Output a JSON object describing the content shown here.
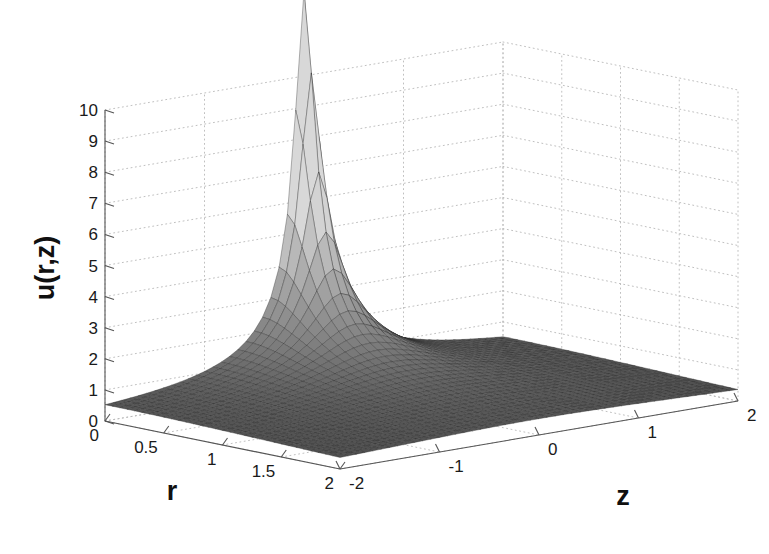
{
  "figure": {
    "type": "surface-plot-3d",
    "background_color": "#ffffff",
    "width": 769,
    "height": 554
  },
  "axes": {
    "vertical": {
      "title": "u(r,z)",
      "ticks": [
        "0",
        "1",
        "2",
        "3",
        "4",
        "5",
        "6",
        "7",
        "8",
        "9",
        "10"
      ],
      "min": 0,
      "max": 10
    },
    "left_horizontal": {
      "title": "r",
      "ticks": [
        "0",
        "0.5",
        "1",
        "1.5",
        "2"
      ],
      "min": 0,
      "max": 2
    },
    "right_horizontal": {
      "title": "z",
      "ticks": [
        "-2",
        "-1",
        "0",
        "1",
        "2"
      ],
      "min": -2,
      "max": 2
    }
  },
  "chart_data": {
    "type": "surface",
    "title": "",
    "xlabel": "r",
    "ylabel": "z",
    "zlabel": "u(r,z)",
    "xlim": [
      0,
      2
    ],
    "ylim": [
      -2,
      2
    ],
    "zlim": [
      0,
      10
    ],
    "xticks": [
      0,
      0.5,
      1,
      1.5,
      2
    ],
    "yticks": [
      -2,
      -1,
      0,
      1,
      2
    ],
    "zticks": [
      0,
      1,
      2,
      3,
      4,
      5,
      6,
      7,
      8,
      9,
      10
    ],
    "grid": true,
    "legend": "none",
    "colormap": "gray",
    "shading": "faceted",
    "peak_location": {
      "r": 0.0,
      "z": 0.0
    },
    "peak_value_approx": 12.5,
    "surface_model": {
      "form": "amplitude / sqrt(r^2 + z^2 + eps2)",
      "amplitude": 1.05,
      "eps2": 0.0068
    },
    "grid_resolution": {
      "nr": 33,
      "nz": 49
    },
    "sample_points": [
      {
        "r": 0.0,
        "z": 0.0,
        "u": 12.73
      },
      {
        "r": 0.0,
        "z": 0.25,
        "u": 4.09
      },
      {
        "r": 0.0,
        "z": 0.5,
        "u": 2.09
      },
      {
        "r": 0.0,
        "z": 1.0,
        "u": 1.05
      },
      {
        "r": 0.0,
        "z": 2.0,
        "u": 0.53
      },
      {
        "r": 0.0,
        "z": -0.25,
        "u": 4.09
      },
      {
        "r": 0.0,
        "z": -1.0,
        "u": 1.05
      },
      {
        "r": 0.0,
        "z": -2.0,
        "u": 0.53
      },
      {
        "r": 0.25,
        "z": 0.0,
        "u": 4.09
      },
      {
        "r": 0.5,
        "z": 0.0,
        "u": 2.09
      },
      {
        "r": 1.0,
        "z": 0.0,
        "u": 1.05
      },
      {
        "r": 2.0,
        "z": 0.0,
        "u": 0.52
      },
      {
        "r": 0.5,
        "z": 0.5,
        "u": 1.48
      },
      {
        "r": 1.0,
        "z": 1.0,
        "u": 0.74
      },
      {
        "r": 2.0,
        "z": 2.0,
        "u": 0.37
      },
      {
        "r": 2.0,
        "z": -2.0,
        "u": 0.37
      }
    ],
    "view": {
      "azimuth_deg": -37.5,
      "elevation_deg": 30
    }
  },
  "colors": {
    "surface_low": "#3a3a3a",
    "surface_high": "#d8d8d8",
    "mesh_line": "#2a2a2a",
    "grid": "#b9b9b9",
    "axis": "#555555",
    "text": "#1a1a1a"
  }
}
